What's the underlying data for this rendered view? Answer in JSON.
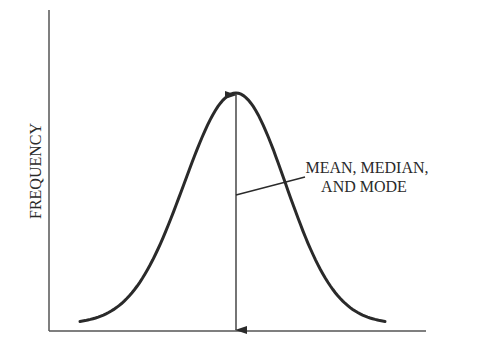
{
  "chart_data": {
    "type": "line",
    "title": "",
    "xlabel": "",
    "ylabel": "FREQUENCY",
    "annotation": {
      "lines": [
        "MEAN, MEDIAN,",
        "AND MODE"
      ],
      "points_to": "center of the distribution (peak)"
    },
    "distribution": {
      "shape": "normal",
      "mean": 0,
      "sd": 1,
      "x_range": [
        -3,
        3
      ]
    },
    "grid": false,
    "legend": "none"
  },
  "colors": {
    "ink": "#2a2a2a",
    "background": "#ffffff"
  }
}
